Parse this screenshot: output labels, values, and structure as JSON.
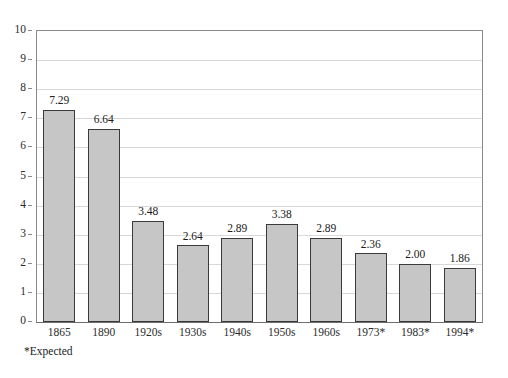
{
  "footnote": "*Expected",
  "colors": {
    "bar_fill": "#c6c6c6",
    "bar_border": "#3a3a3a",
    "gridline": "#d8d8d8",
    "axis": "#8a8a8a",
    "text": "#1a1a1a",
    "background": "#ffffff"
  },
  "chart_data": {
    "type": "bar",
    "title": "",
    "xlabel": "",
    "ylabel": "",
    "ylim": [
      0,
      10
    ],
    "ytick_labels": [
      "10",
      "9",
      "8",
      "7",
      "6",
      "5",
      "4",
      "3",
      "2",
      "1",
      "0"
    ],
    "yticks": [
      10,
      9,
      8,
      7,
      6,
      5,
      4,
      3,
      2,
      1,
      0
    ],
    "grid": true,
    "legend": false,
    "categories": [
      "1865",
      "1890",
      "1920s",
      "1930s",
      "1940s",
      "1950s",
      "1960s",
      "1973*",
      "1983*",
      "1994*"
    ],
    "values": [
      7.29,
      6.64,
      3.48,
      2.64,
      2.89,
      3.38,
      2.89,
      2.36,
      2.0,
      1.86
    ],
    "value_labels": [
      "7.29",
      "6.64",
      "3.48",
      "2.64",
      "2.89",
      "3.38",
      "2.89",
      "2.36",
      "2.00",
      "1.86"
    ],
    "annotations": [
      "*Expected"
    ]
  }
}
